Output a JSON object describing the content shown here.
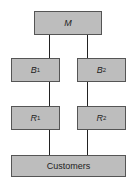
{
  "diagram": {
    "top": {
      "label": "M"
    },
    "level2": [
      {
        "label": "B",
        "sub": "1"
      },
      {
        "label": "B",
        "sub": "2"
      }
    ],
    "level3": [
      {
        "label": "R",
        "sub": "1"
      },
      {
        "label": "R",
        "sub": "2"
      }
    ],
    "bottom": {
      "label": "Customers"
    },
    "colors": {
      "box_fill": "#bdbdbd",
      "box_border": "#555555",
      "line": "#222222"
    }
  }
}
